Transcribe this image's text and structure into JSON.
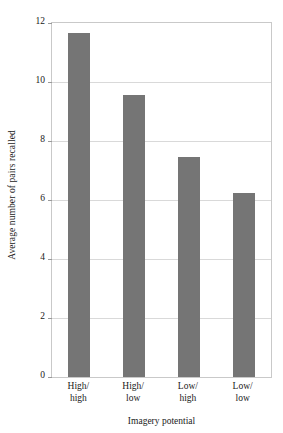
{
  "chart_data": {
    "type": "bar",
    "title": "",
    "subtitle": "",
    "xlabel": "Imagery potential",
    "ylabel": "Average number of pairs recalled",
    "categories": [
      "High/\nhigh",
      "High/\nlow",
      "Low/\nhigh",
      "Low/\nlow"
    ],
    "category_lines": [
      {
        "line1": "High/",
        "line2": "high"
      },
      {
        "line1": "High/",
        "line2": "low"
      },
      {
        "line1": "Low/",
        "line2": "high"
      },
      {
        "line1": "Low/",
        "line2": "low"
      }
    ],
    "values": [
      11.65,
      9.55,
      7.45,
      6.25
    ],
    "ylim": [
      0,
      12
    ],
    "xlim": [
      0,
      4
    ],
    "yticks": [
      0,
      2,
      4,
      6,
      8,
      10,
      12
    ],
    "ytick_labels": [
      "0",
      "2",
      "4",
      "6",
      "8",
      "10",
      "12"
    ],
    "grid": true,
    "grid_axis": "y",
    "legend": false,
    "legend_position": "none",
    "bar_color": "#757575",
    "grid_color": "#d9d9d9",
    "frame_color": "#c9c9c9",
    "background_color": "#ffffff",
    "text_color": "#1a1a1a"
  }
}
